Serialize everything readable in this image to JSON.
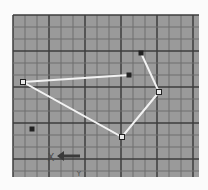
{
  "canvas": {
    "width": 208,
    "height": 190,
    "background": "#fbfbfb"
  },
  "grid": {
    "x": 13,
    "y": 15,
    "width": 186,
    "height": 162,
    "fill": "#9a9a9a",
    "minor_spacing": 12,
    "minor_color": "#6e6e6e",
    "major_every": 3,
    "major_color": "#3c3c3c"
  },
  "polyline": {
    "color": "#f2f2f2",
    "points": [
      [
        129,
        75
      ],
      [
        23,
        82
      ],
      [
        122,
        137
      ],
      [
        159,
        92
      ],
      [
        141,
        53
      ]
    ]
  },
  "points": [
    {
      "name": "vertex-left",
      "x": 23,
      "y": 82,
      "style": "open"
    },
    {
      "name": "vertex-end-mid",
      "x": 129,
      "y": 75,
      "style": "filled"
    },
    {
      "name": "vertex-top",
      "x": 141,
      "y": 53,
      "style": "filled"
    },
    {
      "name": "vertex-right",
      "x": 159,
      "y": 92,
      "style": "open"
    },
    {
      "name": "vertex-bottom",
      "x": 122,
      "y": 137,
      "style": "open"
    },
    {
      "name": "isolated-point",
      "x": 32,
      "y": 129,
      "style": "filled"
    }
  ],
  "axis_indicator": {
    "x_label": "X",
    "y_label": "Y",
    "arrow_direction": "left"
  },
  "colors": {
    "point_fill": "#222222",
    "open_point_fill": "#e8e8e8",
    "label": "#4a4a4a"
  }
}
